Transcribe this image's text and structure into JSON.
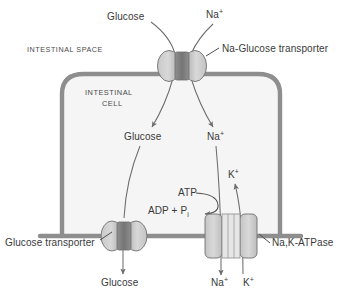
{
  "figure": {
    "compartments": {
      "outside_label": "INTESTINAL SPACE",
      "inside_label_line1": "INTESTINAL",
      "inside_label_line2": "CELL"
    },
    "colors": {
      "membrane": "#8e8e8e",
      "cell_fill": "#f4f4f4",
      "protein_light": "#cfcfcf",
      "protein_dark": "#8a8a8a",
      "arrow": "#6d6d6d",
      "text": "#3a3a3a"
    },
    "proteins": [
      {
        "id": "na-glucose-transporter",
        "label": "Na-Glucose transporter",
        "shape": "two-lobe",
        "location": "apical"
      },
      {
        "id": "glucose-transporter",
        "label": "Glucose transporter",
        "shape": "two-lobe",
        "location": "basolateral-left"
      },
      {
        "id": "na-k-atpase",
        "label_part1": "Na",
        "label_comma": ",",
        "label_part2": "K-ATPase",
        "label": "Na,K-ATPase",
        "shape": "rectangular-channel",
        "location": "basolateral-right"
      }
    ],
    "species": {
      "glucose": "Glucose",
      "sodium": "Na",
      "potassium": "K",
      "plus": "+",
      "atp": "ATP",
      "adp": "ADP + P",
      "adp_sub": "i"
    },
    "labels": {
      "glucose_apical_in": "Glucose",
      "sodium_apical_in": "Na",
      "glucose_cytosol": "Glucose",
      "sodium_cytosol": "Na",
      "potassium_cytosol": "K",
      "glucose_basal_out": "Glucose",
      "sodium_basal_out": "Na",
      "potassium_basal_out": "K",
      "atp": "ATP",
      "adp_pi": "ADP + P",
      "adp_pi_sub": "i",
      "na_glucose_transporter": "Na-Glucose transporter",
      "glucose_transporter": "Glucose transporter",
      "na_k_atpase_na": "Na",
      "na_k_atpase_rest": ",K-ATPase",
      "intestinal_space": "INTESTINAL SPACE",
      "intestinal_cell_1": "INTESTINAL",
      "intestinal_cell_2": "CELL"
    }
  }
}
